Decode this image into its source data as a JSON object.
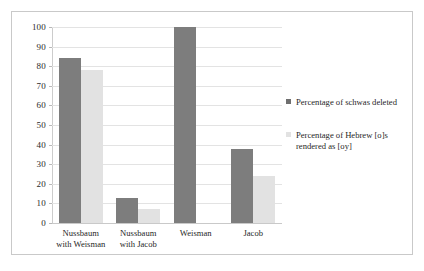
{
  "chart_data": {
    "type": "bar",
    "title": "",
    "subtitle": "",
    "xlabel": "",
    "ylabel": "",
    "ylim": [
      0,
      100
    ],
    "yticks": [
      0,
      10,
      20,
      30,
      40,
      50,
      60,
      70,
      80,
      90,
      100
    ],
    "grid": true,
    "legend_position": "right",
    "categories": [
      "Nussbaum with Weisman",
      "Nussbaum with Jacob",
      "Weisman",
      "Jacob"
    ],
    "category_lines": [
      [
        "Nussbaum",
        "with Weisman"
      ],
      [
        "Nussbaum",
        "with Jacob"
      ],
      [
        "Weisman",
        ""
      ],
      [
        "Jacob",
        ""
      ]
    ],
    "series": [
      {
        "name": "Percentage of schwas deleted",
        "color": "#7d7d7d",
        "values": [
          84,
          13,
          100,
          38
        ]
      },
      {
        "name": "Percentage of Hebrew [o]s rendered as [oy]",
        "color": "#e2e2e2",
        "values": [
          78,
          7,
          0,
          24
        ]
      }
    ]
  },
  "legend": {
    "entries": [
      {
        "label": "Percentage of schwas deleted"
      },
      {
        "label": "Percentage of Hebrew [o]s rendered as [oy]"
      }
    ]
  },
  "colors": {
    "series_a": "#7d7d7d",
    "series_b": "#e2e2e2",
    "frame_border": "#c9c9c9",
    "gridline": "#e3e3e3",
    "text": "#1f1f1f"
  }
}
